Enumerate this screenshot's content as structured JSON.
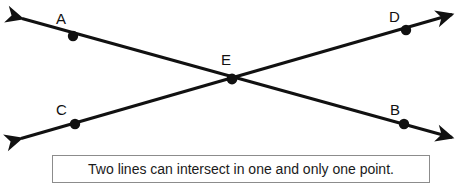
{
  "figure": {
    "type": "geometry-diagram",
    "background_color": "#ffffff",
    "stroke_color": "#111111",
    "caption": {
      "text": "Two lines can intersect in one and only one point.",
      "border_color": "#8c8c8c",
      "fill_color": "#ffffff"
    },
    "points": [
      {
        "id": "A",
        "label": "A",
        "x": 73,
        "y": 36
      },
      {
        "id": "D",
        "label": "D",
        "x": 406,
        "y": 30
      },
      {
        "id": "E",
        "label": "E",
        "x": 232,
        "y": 79
      },
      {
        "id": "C",
        "label": "C",
        "x": 75,
        "y": 124
      },
      {
        "id": "B",
        "label": "B",
        "x": 404,
        "y": 124
      }
    ],
    "lines": [
      {
        "id": "line-AB",
        "name": "line-ab",
        "through": [
          "A",
          "E",
          "B"
        ],
        "arrow_start": {
          "x": 19,
          "y": 17
        },
        "arrow_end": {
          "x": 455,
          "y": 139
        },
        "double_headed": true
      },
      {
        "id": "line-CD",
        "name": "line-cd",
        "through": [
          "C",
          "E",
          "D"
        ],
        "arrow_start": {
          "x": 18,
          "y": 140
        },
        "arrow_end": {
          "x": 455,
          "y": 13
        },
        "double_headed": true
      }
    ],
    "intersection": {
      "point": "E",
      "count": 1
    }
  }
}
